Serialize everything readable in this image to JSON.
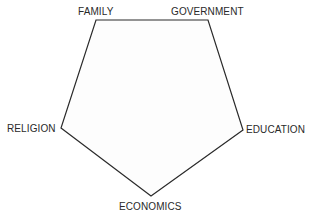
{
  "diagram": {
    "type": "pentagon",
    "stroke_color": "#2a2a2a",
    "fill_color": "#fdfdfd",
    "nodes": [
      {
        "id": "family",
        "label": "FAMILY",
        "x": 96,
        "y": 20
      },
      {
        "id": "government",
        "label": "GOVERNMENT",
        "x": 208,
        "y": 20
      },
      {
        "id": "education",
        "label": "EDUCATION",
        "x": 243,
        "y": 130
      },
      {
        "id": "economics",
        "label": "ECONOMICS",
        "x": 151,
        "y": 196
      },
      {
        "id": "religion",
        "label": "RELIGION",
        "x": 61,
        "y": 128
      }
    ],
    "edges": [
      [
        "family",
        "government"
      ],
      [
        "government",
        "education"
      ],
      [
        "education",
        "economics"
      ],
      [
        "economics",
        "religion"
      ],
      [
        "religion",
        "family"
      ]
    ]
  }
}
